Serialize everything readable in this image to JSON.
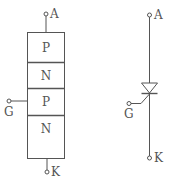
{
  "diagram": {
    "layer_structure": {
      "layers": [
        "P",
        "N",
        "P",
        "N"
      ],
      "terminals": {
        "anode": "A",
        "gate": "G",
        "cathode": "K"
      }
    },
    "symbol": {
      "terminals": {
        "anode": "A",
        "gate": "G",
        "cathode": "K"
      }
    },
    "colors": {
      "line": "#555555",
      "background": "#ffffff"
    }
  }
}
